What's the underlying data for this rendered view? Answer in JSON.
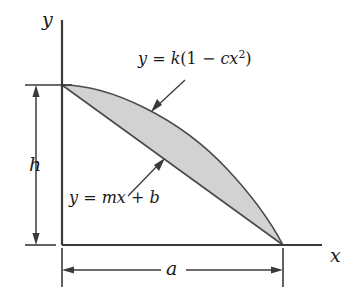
{
  "figure": {
    "type": "math-diagram",
    "background_color": "#ffffff",
    "stroke_color": "#3a3a3a",
    "shade_fill_color": "#d2d2d2",
    "axes": {
      "y_label": "y",
      "x_label": "x",
      "origin": [
        62,
        245
      ],
      "y_axis_top": [
        62,
        20
      ],
      "x_axis_right": [
        322,
        245
      ]
    },
    "dimensions": [
      {
        "name": "h",
        "label": "h",
        "orientation": "vertical",
        "from": [
          36,
          85
        ],
        "to": [
          36,
          245
        ]
      },
      {
        "name": "a",
        "label": "a",
        "orientation": "horizontal",
        "from": [
          62,
          270
        ],
        "to": [
          283,
          270
        ]
      }
    ],
    "curves": [
      {
        "name": "parabola",
        "equation": "y = k(1 - cx²)",
        "equation_parts": {
          "lhs": "y",
          "equals": "=",
          "k": "k",
          "open_paren": "(",
          "one": "1",
          "minus": "−",
          "c": "c",
          "x": "x",
          "exponent": "2",
          "close_paren": ")"
        },
        "start": [
          62,
          85
        ],
        "end": [
          283,
          245
        ]
      },
      {
        "name": "straight-line",
        "equation": "y = mx + b",
        "equation_parts": {
          "lhs": "y",
          "equals": "=",
          "m": "m",
          "x": "x",
          "plus": "+",
          "b": "b"
        },
        "start": [
          62,
          85
        ],
        "end": [
          283,
          245
        ]
      }
    ],
    "shaded_region": {
      "name": "area-between-curves",
      "bounded_above_by": "parabola",
      "bounded_below_by": "straight-line"
    },
    "leader_lines": [
      {
        "name": "curve-leader",
        "from": [
          185,
          80
        ],
        "to": [
          152,
          111
        ],
        "points_to": "parabola"
      },
      {
        "name": "line-leader",
        "from": [
          128,
          196
        ],
        "to": [
          164,
          159
        ],
        "points_to": "straight-line"
      }
    ]
  }
}
